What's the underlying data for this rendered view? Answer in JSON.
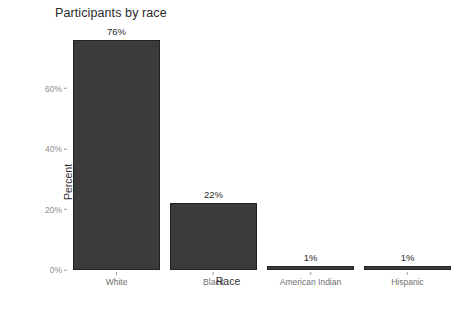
{
  "chart_data": {
    "type": "bar",
    "title": "Participants by race",
    "xlabel": "Race",
    "ylabel": "Percent",
    "categories": [
      "White",
      "Black",
      "American Indian",
      "Hispanic"
    ],
    "values": [
      76,
      22,
      1,
      1
    ],
    "value_labels": [
      "76%",
      "22%",
      "1%",
      "1%"
    ],
    "ylim": [
      0,
      80
    ],
    "ytick_values": [
      0,
      20,
      40,
      60
    ],
    "ytick_labels": [
      "0%",
      "20%",
      "40%",
      "60%"
    ],
    "grid": false,
    "legend": "none",
    "bar_color": "#3b3b3b",
    "background_color": "#ffffff"
  }
}
